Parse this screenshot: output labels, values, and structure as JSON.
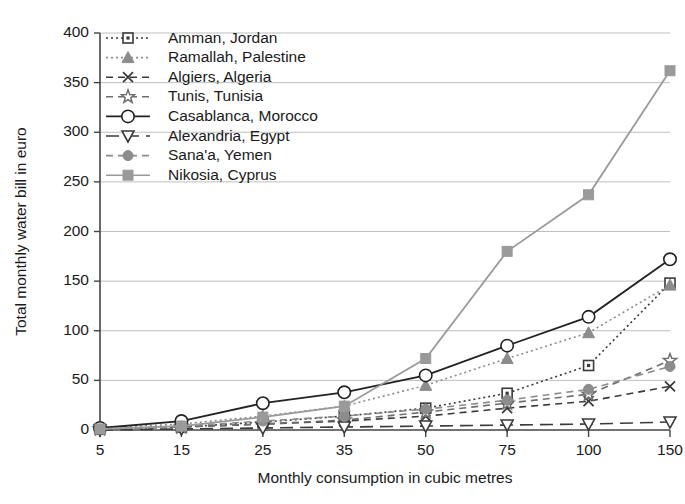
{
  "chart_data": {
    "type": "line",
    "title": "",
    "xlabel": "Monthly consumption in cubic metres",
    "ylabel": "Total monthly water bill in euro",
    "categories": [
      "5",
      "15",
      "25",
      "35",
      "50",
      "75",
      "100",
      "150"
    ],
    "ylim": [
      0,
      400
    ],
    "yticks": [
      "0",
      "50",
      "100",
      "150",
      "200",
      "250",
      "300",
      "350",
      "400"
    ],
    "grid": "horizontal",
    "legend_position": "top-left-inside",
    "series": [
      {
        "name": "Amman, Jordan",
        "marker": "open-square",
        "line_style": "dotted",
        "color": "#3a3a3a",
        "values": [
          1,
          3,
          8,
          14,
          22,
          37,
          65,
          148
        ]
      },
      {
        "name": "Ramallah, Palestine",
        "marker": "filled-triangle",
        "line_style": "dotted",
        "color": "#8c8c8c",
        "values": [
          2,
          6,
          14,
          24,
          45,
          72,
          98,
          146
        ]
      },
      {
        "name": "Algiers, Algeria",
        "marker": "cross-x",
        "line_style": "dashed",
        "color": "#3a3a3a",
        "values": [
          1,
          3,
          6,
          9,
          14,
          22,
          29,
          44
        ]
      },
      {
        "name": "Tunis, Tunisia",
        "marker": "open-star",
        "line_style": "dashed",
        "color": "#6e6e6e",
        "values": [
          1,
          3,
          6,
          10,
          18,
          27,
          36,
          70
        ]
      },
      {
        "name": "Casablanca, Morocco",
        "marker": "open-circle",
        "line_style": "solid",
        "color": "#222222",
        "values": [
          2,
          9,
          27,
          38,
          55,
          85,
          114,
          172
        ]
      },
      {
        "name": "Alexandria, Egypt",
        "marker": "open-triangle-down",
        "line_style": "long-dash",
        "color": "#3a3a3a",
        "values": [
          0,
          1,
          2,
          3,
          4,
          5,
          6,
          8
        ]
      },
      {
        "name": "Sana'a, Yemen",
        "marker": "filled-circle",
        "line_style": "dashed",
        "color": "#8c8c8c",
        "values": [
          1,
          4,
          9,
          14,
          21,
          30,
          41,
          64
        ]
      },
      {
        "name": "Nikosia, Cyprus",
        "marker": "filled-square",
        "line_style": "solid",
        "color": "#9a9a9a",
        "values": [
          1,
          4,
          13,
          24,
          72,
          180,
          237,
          362
        ]
      }
    ]
  }
}
